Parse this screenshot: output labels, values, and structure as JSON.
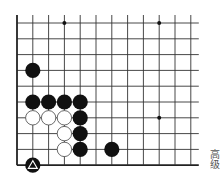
{
  "board": {
    "size": 19,
    "visible_cols": 12,
    "visible_rows": 10,
    "origin_x": 17,
    "origin_y": 23,
    "spacing": 15.8,
    "line_extend_right": 8,
    "line_extend_top": 8,
    "edges": {
      "left": true,
      "bottom": true
    },
    "line_color": "#333333",
    "edge_color": "#222222",
    "star_points": [
      {
        "col": 3,
        "row": 0
      },
      {
        "col": 9,
        "row": 0
      },
      {
        "col": 9,
        "row": 6
      }
    ],
    "stones": [
      {
        "col": 1,
        "row": 3,
        "color": "black"
      },
      {
        "col": 1,
        "row": 5,
        "color": "black"
      },
      {
        "col": 2,
        "row": 5,
        "color": "black"
      },
      {
        "col": 3,
        "row": 5,
        "color": "black"
      },
      {
        "col": 4,
        "row": 5,
        "color": "black"
      },
      {
        "col": 1,
        "row": 6,
        "color": "white"
      },
      {
        "col": 2,
        "row": 6,
        "color": "white"
      },
      {
        "col": 3,
        "row": 6,
        "color": "white"
      },
      {
        "col": 4,
        "row": 6,
        "color": "black"
      },
      {
        "col": 3,
        "row": 7,
        "color": "white"
      },
      {
        "col": 4,
        "row": 7,
        "color": "black"
      },
      {
        "col": 3,
        "row": 8,
        "color": "white"
      },
      {
        "col": 4,
        "row": 8,
        "color": "black"
      },
      {
        "col": 6,
        "row": 8,
        "color": "black"
      },
      {
        "col": 1,
        "row": 9,
        "color": "black",
        "marker": "triangle"
      }
    ],
    "black_color": "#111111",
    "white_fill": "#ffffff",
    "white_stroke": "#444444",
    "marker_color": "#ffffff"
  },
  "label": {
    "level": "高级"
  }
}
